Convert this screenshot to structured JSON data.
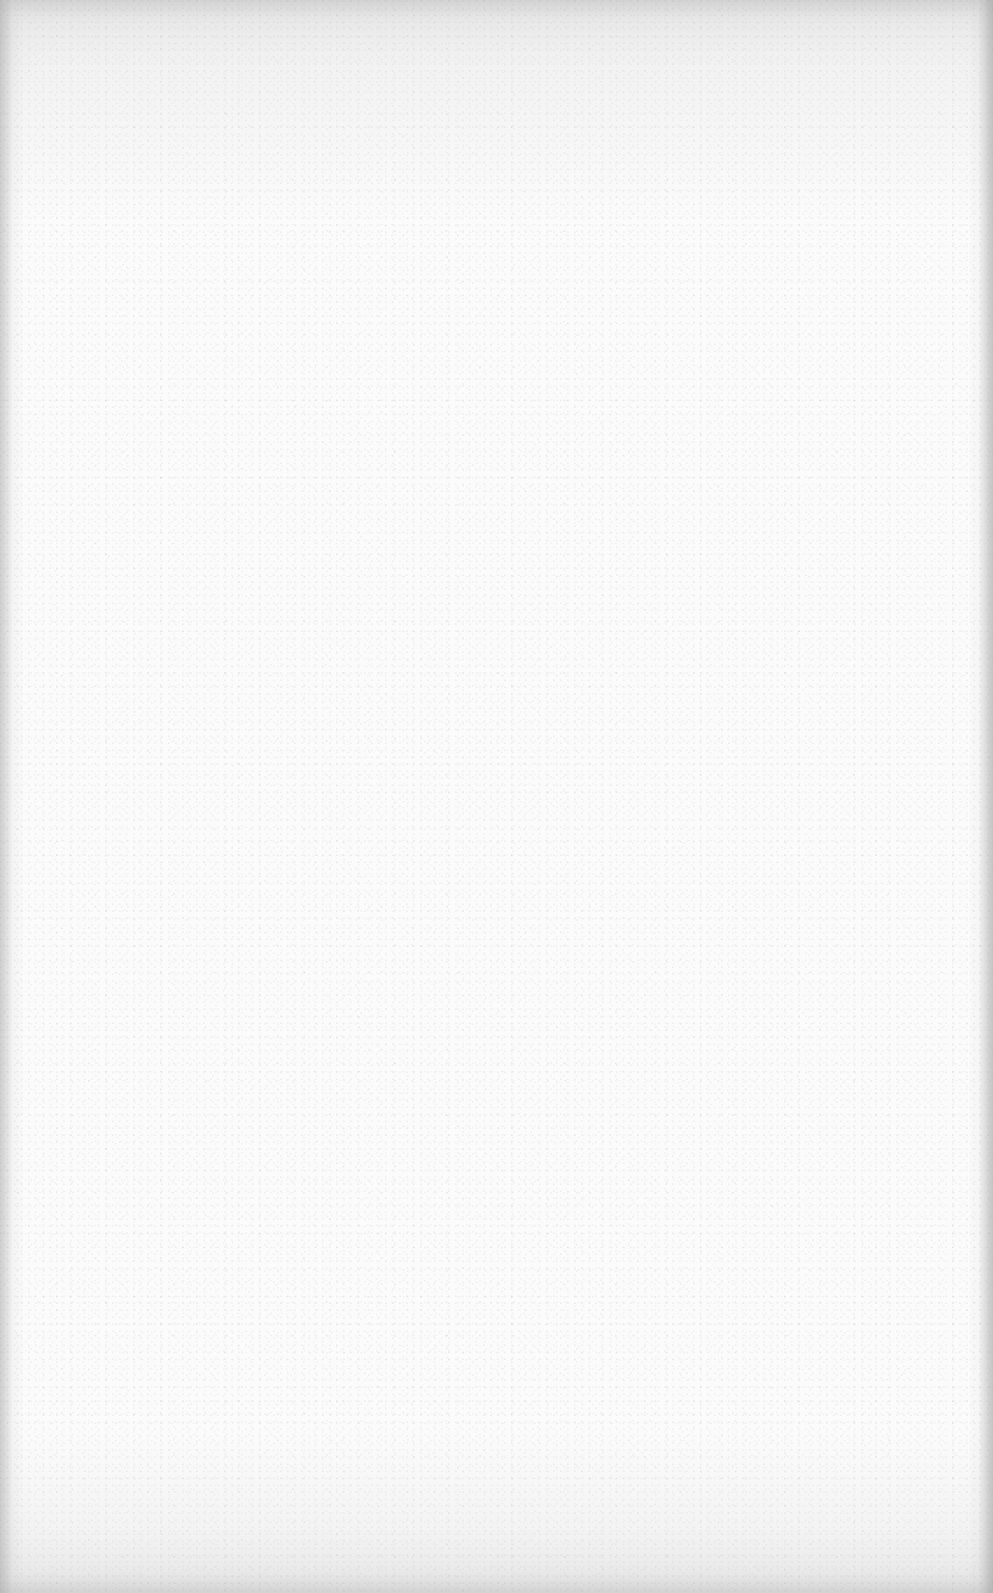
{
  "document": {
    "type": "blank scanned page",
    "text": [],
    "colors": {
      "paper": "#fbfbfb",
      "edge_shadow": "#bebebe"
    }
  }
}
